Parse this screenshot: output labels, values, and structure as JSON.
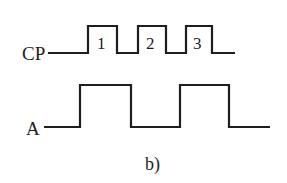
{
  "figure": {
    "caption": "b)",
    "signals": [
      {
        "name": "CP",
        "label": "CP",
        "pulse_labels": [
          "1",
          "2",
          "3"
        ]
      },
      {
        "name": "A",
        "label": "A"
      }
    ],
    "colors": {
      "line": "#1e1e1e",
      "background": "#ffffff"
    }
  }
}
